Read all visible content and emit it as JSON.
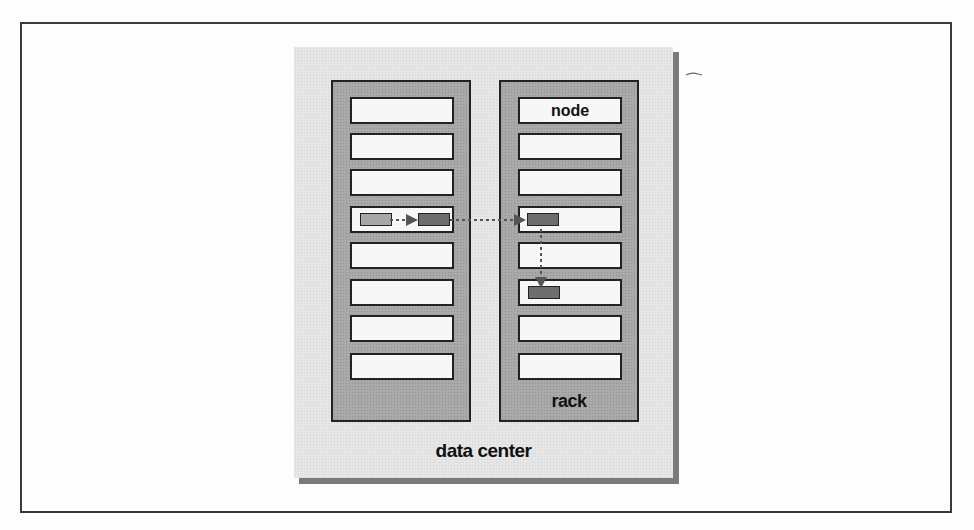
{
  "diagram": {
    "data_center": {
      "label": "data center"
    },
    "racks": [
      {
        "id": "rack-1",
        "label": "",
        "nodes": [
          "",
          "",
          "",
          "",
          "",
          "",
          "",
          ""
        ]
      },
      {
        "id": "rack-2",
        "label": "rack",
        "nodes": [
          "node",
          "",
          "",
          "",
          "",
          "",
          "",
          ""
        ]
      }
    ],
    "blocks": [
      {
        "rack": 1,
        "node_index": 3,
        "shade": "light"
      },
      {
        "rack": 1,
        "node_index": 3,
        "shade": "dark"
      },
      {
        "rack": 2,
        "node_index": 3,
        "shade": "dark"
      },
      {
        "rack": 2,
        "node_index": 5,
        "shade": "dark"
      }
    ],
    "arrows": [
      {
        "from": "rack-1 node 4 block 1",
        "to": "rack-1 node 4 block 2",
        "style": "dotted"
      },
      {
        "from": "rack-1 node 4 block 2",
        "to": "rack-2 node 4 block",
        "style": "dotted"
      },
      {
        "from": "rack-2 node 4 block",
        "to": "rack-2 node 6 block",
        "style": "dotted"
      }
    ],
    "colors": {
      "data_center_fill": "#e6e6e6",
      "rack_fill": "#a9a9a9",
      "node_fill": "#f7f7f7",
      "block_light": "#a8a8a8",
      "block_dark": "#6d6d6d",
      "outline": "#222222"
    }
  }
}
